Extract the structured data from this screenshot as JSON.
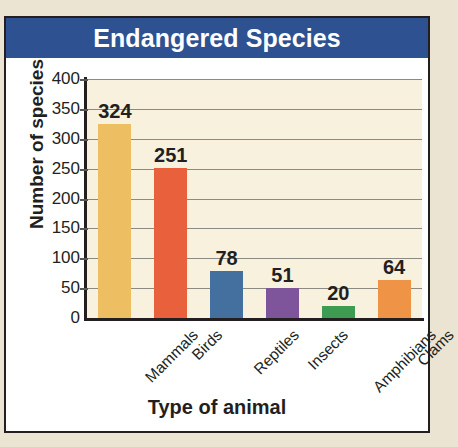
{
  "card": {
    "title": "Endangered Species",
    "title_bg_color": "#2d5191",
    "title_text_color": "#ffffff",
    "page_bg_color": "#ece4d2",
    "plot_bg_color": "#f7f1dd",
    "border_color": "#231f20"
  },
  "chart_data": {
    "type": "bar",
    "title": "Endangered Species",
    "xlabel": "Type of animal",
    "ylabel": "Number of species",
    "categories": [
      "Mammals",
      "Birds",
      "Reptiles",
      "Insects",
      "Amphibians",
      "Clams"
    ],
    "values": [
      324,
      251,
      78,
      51,
      20,
      64
    ],
    "value_labels": [
      "324",
      "251",
      "78",
      "51",
      "20",
      "64"
    ],
    "bar_colors": [
      "#edbf62",
      "#e8603c",
      "#44709f",
      "#7e559b",
      "#3d9b52",
      "#ef9347"
    ],
    "ylim": [
      0,
      400
    ],
    "ytick_step": 50,
    "ytick_labels": [
      "400",
      "350",
      "300",
      "250",
      "200",
      "150",
      "100",
      "50",
      "0"
    ],
    "ytick_values": [
      400,
      350,
      300,
      250,
      200,
      150,
      100,
      50,
      0
    ],
    "grid": true,
    "grid_color": "#8b8b84",
    "legend": "none",
    "category_label_rotation": -45
  }
}
